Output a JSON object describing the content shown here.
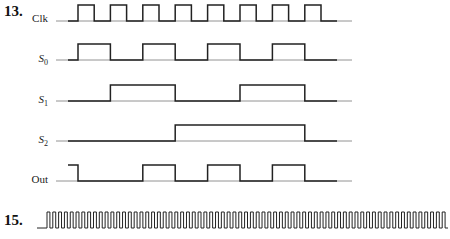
{
  "problems": [
    {
      "number": "13.",
      "signals": [
        {
          "name": "Clk",
          "subscript": ""
        },
        {
          "name": "S",
          "subscript": "0"
        },
        {
          "name": "S",
          "subscript": "1"
        },
        {
          "name": "S",
          "subscript": "2"
        },
        {
          "name": "Out",
          "subscript": ""
        }
      ]
    },
    {
      "number": "15.",
      "signals": [
        {
          "name": "",
          "subscript": "",
          "description": "high-frequency clock pulse train (~69 pulses)"
        }
      ]
    }
  ],
  "chart_data": {
    "type": "timing",
    "x_unit": "clock half-period",
    "signals": {
      "Clk": [
        0,
        1,
        0,
        1,
        0,
        1,
        0,
        1,
        0,
        1,
        0,
        1,
        0,
        1,
        0,
        1,
        0
      ],
      "S0": [
        0,
        1,
        1,
        0,
        0,
        1,
        1,
        0,
        0,
        1,
        1,
        0,
        0,
        1,
        1,
        0,
        0
      ],
      "S1": [
        0,
        0,
        0,
        1,
        1,
        1,
        1,
        0,
        0,
        0,
        0,
        1,
        1,
        1,
        1,
        0,
        0
      ],
      "S2": [
        0,
        0,
        0,
        0,
        0,
        0,
        0,
        1,
        1,
        1,
        1,
        1,
        1,
        1,
        1,
        0,
        0
      ],
      "Out": [
        1,
        0,
        0,
        0,
        0,
        1,
        1,
        0,
        0,
        1,
        1,
        0,
        0,
        1,
        1,
        0,
        0
      ]
    },
    "problem_15": {
      "type": "clock",
      "pulse_count": 69
    }
  }
}
